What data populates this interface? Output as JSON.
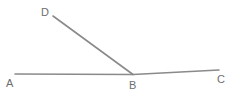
{
  "figure": {
    "background_color": "#ffffff",
    "stroke_color": "#8a8a8a",
    "label_color": "#6e6e6e",
    "width": 233,
    "height": 95,
    "points": {
      "A": {
        "label": "A",
        "x": 15,
        "y": 74.0,
        "label_x": 6,
        "label_y": 78
      },
      "B": {
        "label": "B",
        "x": 133,
        "y": 74.5,
        "label_x": 129,
        "label_y": 80
      },
      "C": {
        "label": "C",
        "x": 219,
        "y": 70.0,
        "label_x": 217,
        "label_y": 74
      },
      "D": {
        "label": "D",
        "x": 53,
        "y": 16.0,
        "label_x": 41,
        "label_y": 7
      }
    },
    "segments": [
      {
        "name": "segment-AB",
        "from": "A",
        "to": "B",
        "d": "M 15 74 L 133 74.5"
      },
      {
        "name": "segment-BC",
        "from": "B",
        "to": "C",
        "d": "M 133 74.5 L 219 70"
      },
      {
        "name": "segment-BD",
        "from": "B",
        "to": "D",
        "d": "M 133 74.5 L 53 16"
      }
    ]
  }
}
